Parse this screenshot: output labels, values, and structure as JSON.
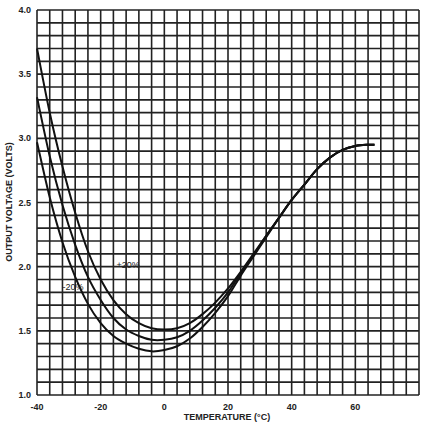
{
  "chart_data": {
    "type": "line",
    "title": "",
    "xlabel": "TEMPERATURE (°C)",
    "ylabel": "OUTPUT VOLTAGE (VOLTS)",
    "xlim": [
      -40,
      80
    ],
    "ylim": [
      1.0,
      4.0
    ],
    "x_ticks": [
      -40,
      -20,
      0,
      20,
      40,
      60
    ],
    "x_tick_labels": [
      "-40",
      "-20",
      "0",
      "20",
      "40",
      "60"
    ],
    "y_ticks": [
      1.0,
      1.5,
      2.0,
      2.5,
      3.0,
      3.5,
      4.0
    ],
    "y_tick_labels": [
      "1.0",
      "1.5",
      "2.0",
      "2.5",
      "3.0",
      "3.5",
      "4.0"
    ],
    "grid": true,
    "grid_x_step": 4,
    "grid_y_step": 0.1,
    "legend": "none",
    "annotations": [
      {
        "text": "+20%",
        "x": -15,
        "y": 1.99
      },
      {
        "text": "-20%",
        "x": -32,
        "y": 1.82
      }
    ],
    "series": [
      {
        "name": "top curve",
        "x": [
          -40,
          -36,
          -32,
          -28,
          -24,
          -20,
          -16,
          -12,
          -8,
          -4,
          0,
          4,
          8,
          12,
          16,
          20,
          24,
          28,
          32,
          36,
          40,
          44,
          48,
          52,
          56,
          60,
          64,
          66
        ],
        "y": [
          3.7,
          3.2,
          2.78,
          2.42,
          2.12,
          1.9,
          1.74,
          1.63,
          1.56,
          1.52,
          1.51,
          1.52,
          1.56,
          1.63,
          1.72,
          1.83,
          1.96,
          2.1,
          2.24,
          2.38,
          2.52,
          2.64,
          2.76,
          2.85,
          2.91,
          2.94,
          2.95,
          2.95
        ]
      },
      {
        "name": "middle curve",
        "x": [
          -40,
          -36,
          -32,
          -28,
          -24,
          -20,
          -16,
          -12,
          -8,
          -4,
          0,
          4,
          8,
          12,
          16,
          20,
          24,
          28,
          32,
          36,
          40,
          44,
          48,
          52,
          56,
          60,
          64,
          66
        ],
        "y": [
          3.32,
          2.86,
          2.48,
          2.17,
          1.92,
          1.74,
          1.6,
          1.51,
          1.46,
          1.43,
          1.43,
          1.45,
          1.5,
          1.58,
          1.68,
          1.8,
          1.95,
          2.09,
          2.24,
          2.38,
          2.52,
          2.64,
          2.76,
          2.85,
          2.91,
          2.94,
          2.95,
          2.95
        ]
      },
      {
        "name": "bottom curve",
        "x": [
          -40,
          -36,
          -32,
          -28,
          -24,
          -20,
          -16,
          -12,
          -8,
          -4,
          0,
          4,
          8,
          12,
          16,
          20,
          24,
          28,
          32,
          36,
          40,
          44,
          48,
          52,
          56,
          60,
          64,
          66
        ],
        "y": [
          2.97,
          2.54,
          2.19,
          1.92,
          1.71,
          1.56,
          1.46,
          1.4,
          1.36,
          1.34,
          1.35,
          1.38,
          1.44,
          1.53,
          1.64,
          1.77,
          1.93,
          2.08,
          2.23,
          2.38,
          2.52,
          2.64,
          2.76,
          2.85,
          2.91,
          2.94,
          2.95,
          2.95
        ]
      }
    ]
  }
}
